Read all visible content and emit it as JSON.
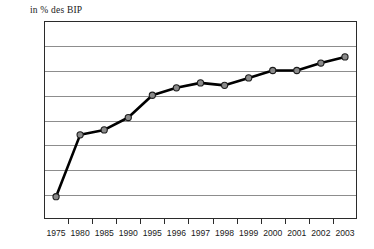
{
  "chart_data": {
    "type": "line",
    "title": "in % des BIP",
    "xlabel": "",
    "ylabel": "",
    "categories": [
      "1975",
      "1980",
      "1985",
      "1990",
      "1995",
      "1996",
      "1997",
      "1998",
      "1999",
      "2000",
      "2001",
      "2002",
      "2003"
    ],
    "values": [
      5.8,
      10.8,
      11.2,
      12.2,
      14.0,
      14.6,
      15.0,
      14.8,
      15.4,
      16.0,
      16.0,
      16.6,
      17.1
    ],
    "series": [
      {
        "name": "in % des BIP",
        "values": [
          5.8,
          10.8,
          11.2,
          12.2,
          14.0,
          14.6,
          15.0,
          14.8,
          15.4,
          16.0,
          16.0,
          16.6,
          17.1
        ]
      }
    ],
    "ylim": [
      4,
      20
    ],
    "ytick_step": 2,
    "yticks": [
      4,
      6,
      8,
      10,
      12,
      14,
      16,
      18,
      20
    ],
    "ytick_labels": [
      "4",
      "6",
      "8",
      "10",
      "12",
      "14",
      "16",
      "18",
      "20"
    ],
    "grid": true,
    "grid_axis": "y",
    "legend": false,
    "legend_position": "none",
    "marker": "circle",
    "colors": {
      "line": "#000000",
      "marker_fill": "#8a8a8a",
      "marker_stroke": "#1c1c1c",
      "gridline": "#8d8d8d",
      "frame": "#2b2b2b",
      "text": "#1a1a1a",
      "background": "#ffffff"
    }
  }
}
